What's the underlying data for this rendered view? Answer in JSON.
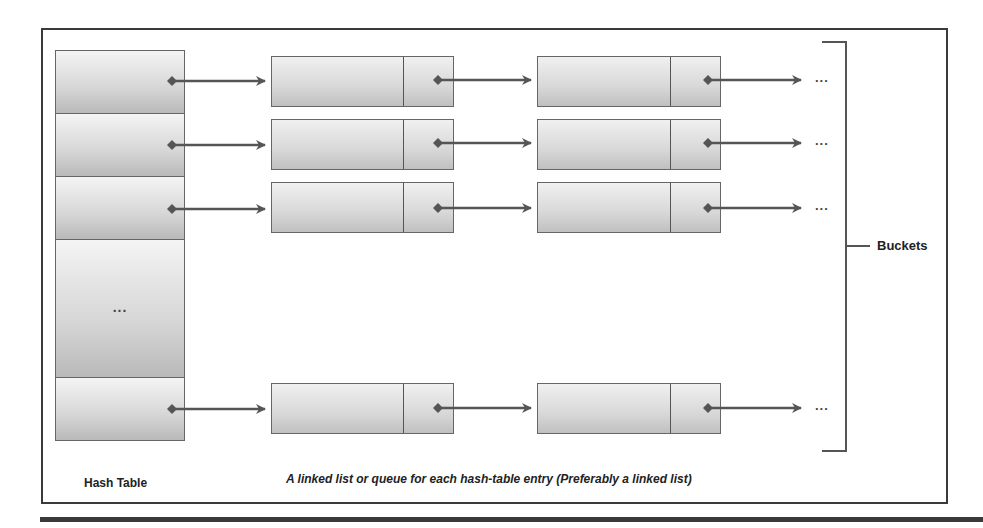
{
  "diagram": {
    "hash_table": {
      "label": "Hash Table",
      "rows": [
        {
          "index": 0,
          "content": "",
          "has_pointer": true
        },
        {
          "index": 1,
          "content": "",
          "has_pointer": true
        },
        {
          "index": 2,
          "content": "",
          "has_pointer": true
        },
        {
          "index": 3,
          "content": "...",
          "has_pointer": false
        },
        {
          "index": 4,
          "content": "",
          "has_pointer": true
        }
      ]
    },
    "chains": [
      {
        "row": 0,
        "nodes": 2,
        "continuation": "..."
      },
      {
        "row": 1,
        "nodes": 2,
        "continuation": "..."
      },
      {
        "row": 2,
        "nodes": 2,
        "continuation": "..."
      },
      {
        "row": 4,
        "nodes": 2,
        "continuation": "..."
      }
    ],
    "bracket_label": "Buckets",
    "caption": "A linked list or queue for each hash-table entry (Preferably a linked list)",
    "colors": {
      "frame": "#3a3a3a",
      "arrow": "#555555",
      "cell_light": "#f4f4f4",
      "cell_dark": "#b9b9b9"
    }
  }
}
